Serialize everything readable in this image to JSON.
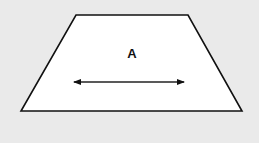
{
  "diagram": {
    "shape": "trapezoid",
    "background_color": "#eaeaea",
    "fill_color": "#ffffff",
    "stroke_color": "#111111",
    "vertices": {
      "top_left": [
        76,
        15
      ],
      "top_right": [
        188,
        15
      ],
      "bottom_right": [
        242,
        111
      ],
      "bottom_left": [
        21,
        111
      ]
    },
    "label": {
      "text": "A",
      "x": 132,
      "y": 53
    },
    "arrow": {
      "type": "double-headed",
      "x1": 73,
      "x2": 185,
      "y": 82
    }
  }
}
